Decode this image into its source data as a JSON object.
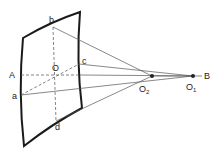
{
  "diagram": {
    "labels": {
      "A": "A",
      "B": "B",
      "O": "O",
      "a": "a",
      "b": "b",
      "c": "c",
      "d": "d",
      "O2_main": "O",
      "O2_sub": "2",
      "O1_main": "O",
      "O1_sub": "1"
    },
    "colors": {
      "frame": "#1a1a1a",
      "rays": "#555555",
      "dashed": "#666666",
      "points": "#222222"
    }
  }
}
